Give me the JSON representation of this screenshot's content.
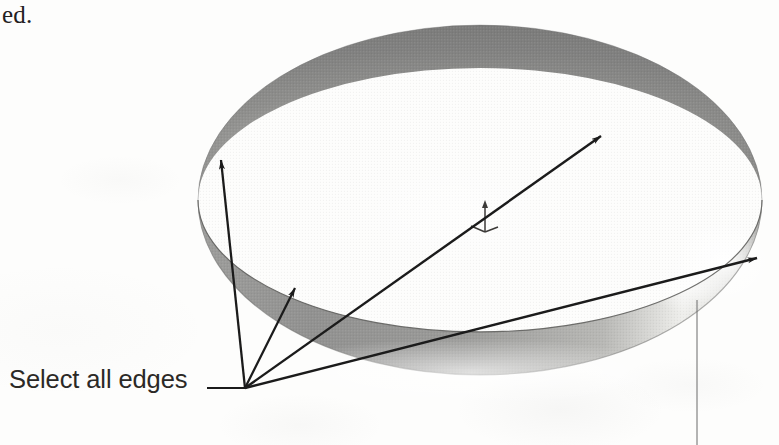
{
  "figure": {
    "title": "Select all edges",
    "page_fragment_text": "ed.",
    "background_color": "#fdfdfc"
  },
  "callout": {
    "label": "Select all edges",
    "label_color": "#2b2926",
    "leader_color": "#1b1b1b",
    "leader_start_x": 207,
    "leader_end_x": 245,
    "leader_y": 388,
    "convergence_x": 245,
    "convergence_y": 388
  },
  "solid": {
    "name": "dome-revolve-solid",
    "description": "Shaded hemispherical dome solid shown in isometric view",
    "fill_top_color": "#8b8b8b",
    "fill_band_color": "#9a9a9a",
    "highlight_color": "#f0f0ee",
    "shadow_color": "#6f6f6f",
    "edge_line_color": "#4a4a4a",
    "center_x": 480,
    "center_y": 200,
    "radius_x": 282,
    "radius_y": 175
  },
  "axis_triad": {
    "name": "coordinate-axis-marker",
    "x": 485,
    "y": 215,
    "color": "#3c3a38"
  },
  "arrows": [
    {
      "id": "arrow-left-edge",
      "label": "pointer to upper-left rim edge",
      "from_x": 245,
      "from_y": 388,
      "to_x": 221,
      "to_y": 160
    },
    {
      "id": "arrow-lower-left-edge",
      "label": "pointer to lower-left silhouette edge",
      "from_x": 245,
      "from_y": 388,
      "to_x": 295,
      "to_y": 288
    },
    {
      "id": "arrow-top-face-edge",
      "label": "pointer to upper interior rim edge",
      "from_x": 245,
      "from_y": 388,
      "to_x": 601,
      "to_y": 136
    },
    {
      "id": "arrow-right-edge",
      "label": "pointer to right rim edge",
      "from_x": 245,
      "from_y": 388,
      "to_x": 757,
      "to_y": 258
    }
  ],
  "leader_line": {
    "id": "vertical-leader",
    "label": "thin vertical leader from bottom rim",
    "x": 697,
    "y_start": 300,
    "y_end": 445,
    "color": "#6a6a6a"
  }
}
